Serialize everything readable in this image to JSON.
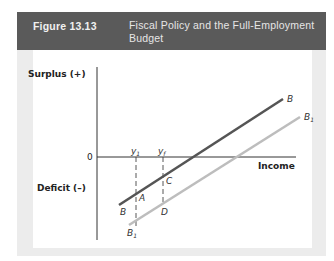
{
  "figure": {
    "number": "Figure 13.13",
    "title": "Fiscal Policy and the Full-Employment Budget"
  },
  "diagram": {
    "y_axis_top_label": "Surplus (+)",
    "y_axis_bottom_label": "Deficit (–)",
    "x_axis_label": "Income",
    "origin_label": "0",
    "income_markers": [
      {
        "label": "y",
        "sub": "1"
      },
      {
        "label": "y",
        "sub": "f"
      }
    ],
    "lines": [
      {
        "name": "B",
        "start_label": "B",
        "end_label": "B",
        "color": "#555555"
      },
      {
        "name": "B1",
        "start_label": "B",
        "start_sub": "1",
        "end_label": "B",
        "end_sub": "1",
        "color": "#bdbdbd"
      }
    ],
    "points": [
      "A",
      "C",
      "D"
    ]
  },
  "colors": {
    "header_bg": "#5a5a5a",
    "panel_bg": "#ececec",
    "budget_line_B": "#555555",
    "budget_line_B1": "#bdbdbd"
  }
}
